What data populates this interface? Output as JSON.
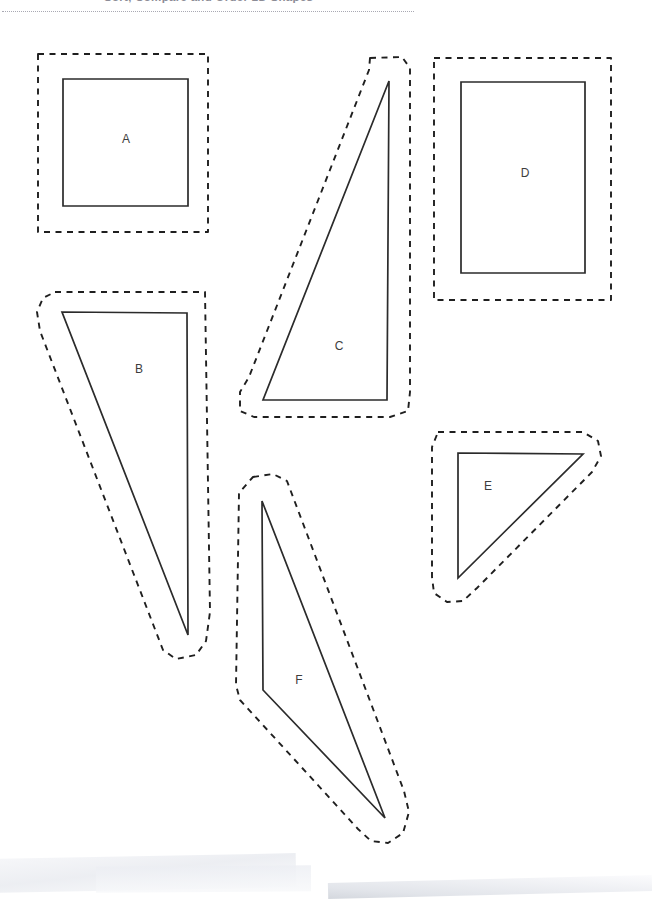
{
  "document": {
    "header_text": "Sort, Compare and Order 2D Shapes",
    "page_background": "#ffffff",
    "ink_color": "#2b2b2b",
    "cut_guide_color": "#1f1f1f",
    "label_color": "#3d3d3d"
  },
  "shapes": [
    {
      "id": "shape-a",
      "label": "A",
      "kind": "square",
      "label_x": 126,
      "label_y": 140,
      "outline_points": "63,79 188,79 188,206 63,206",
      "cut_points": "38,54 208,54 208,232 38,232"
    },
    {
      "id": "shape-b",
      "label": "B",
      "kind": "right-triangle",
      "label_x": 139,
      "label_y": 370,
      "outline_points": "62,312 187,313 188,635",
      "cut_points": "55,292 205,292 210,612 206,641 196,655 176,659 163,650 40,331 37,312 43,298"
    },
    {
      "id": "shape-c",
      "label": "C",
      "kind": "right-triangle",
      "label_x": 339,
      "label_y": 347,
      "outline_points": "389,81 387,400 263,400",
      "cut_points": "370,58 402,57 410,68 410,392 408,411 390,417 254,417 240,411 240,392 249,377 369,70"
    },
    {
      "id": "shape-d",
      "label": "D",
      "kind": "rectangle",
      "label_x": 525,
      "label_y": 174,
      "outline_points": "461,82 585,82 585,273 461,273",
      "cut_points": "434,58 611,58 611,300 434,300"
    },
    {
      "id": "shape-e",
      "label": "E",
      "kind": "right-triangle",
      "label_x": 488,
      "label_y": 487,
      "outline_points": "458,453 583,454 458,578",
      "cut_points": "438,432 583,432 598,441 601,456 592,472 477,588 463,601 447,602 434,593 432,577 432,447"
    },
    {
      "id": "shape-f",
      "label": "F",
      "kind": "obtuse-triangle",
      "label_x": 299,
      "label_y": 681,
      "outline_points": "262,501 385,818 263,690",
      "cut_points": "253,477 273,474 287,481 404,791 409,812 403,833 388,843 371,841 358,829 240,700 236,685 239,493"
    }
  ]
}
